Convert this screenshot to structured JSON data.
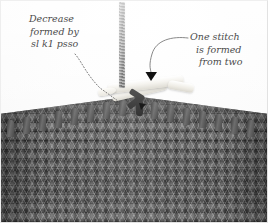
{
  "figure": {
    "background_color": "#fdfdfd",
    "fabric_color": "#585858",
    "needle_color": "#f2f0ea",
    "annotation_color": "#4b4b4b",
    "arrow_color": "#111111"
  },
  "annotations": {
    "left": {
      "name": "decrease-label",
      "line1": "Decrease",
      "line2": "formed by",
      "line3": "sl k1 psso",
      "leader_style": "dotted-curve",
      "points_to": "crossed stitch at left of needle"
    },
    "right": {
      "name": "one-stitch-label",
      "line1": "One stitch",
      "line2": "is formed",
      "line3": "from two",
      "leader_style": "solid-curve-with-arrowhead",
      "points_to": "decrease stitch on needle"
    }
  },
  "photo_elements": {
    "yarn_strand": "working-yarn",
    "needle_lower": "knitting-needle-left",
    "needle_upper": "knitting-needle-right",
    "fabric": "stockinette-knitted-fabric",
    "loops": "stitch-loops-on-needle",
    "arrowhead": "down-pointing-triangle"
  },
  "loop_positions": [
    {
      "x": 6,
      "y": 40
    },
    {
      "x": 22,
      "y": 37
    },
    {
      "x": 38,
      "y": 34
    },
    {
      "x": 54,
      "y": 31
    },
    {
      "x": 70,
      "y": 28
    },
    {
      "x": 86,
      "y": 25
    },
    {
      "x": 102,
      "y": 22
    },
    {
      "x": 118,
      "y": 19
    },
    {
      "x": 134,
      "y": 19
    },
    {
      "x": 150,
      "y": 22
    },
    {
      "x": 166,
      "y": 25
    },
    {
      "x": 182,
      "y": 28
    },
    {
      "x": 198,
      "y": 31
    },
    {
      "x": 214,
      "y": 34
    },
    {
      "x": 230,
      "y": 37
    },
    {
      "x": 246,
      "y": 40
    }
  ]
}
